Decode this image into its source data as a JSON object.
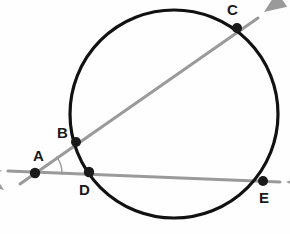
{
  "figure": {
    "background_color": "#fefefe"
  },
  "chart_data": {
    "type": "diagram",
    "subtype": "euclidean-geometry",
    "title": "",
    "canvas": {
      "width": 290,
      "height": 234
    },
    "circle": {
      "name": "main-circle",
      "cx": 174,
      "cy": 114,
      "r": 104,
      "stroke": "#111111",
      "stroke_width": 3.2,
      "fill": "none"
    },
    "points": [
      {
        "id": "A",
        "label": "A",
        "x": 35,
        "y": 173,
        "label_x": 33,
        "label_y": 148,
        "dot_r": 5.2,
        "on_circle": false,
        "color": "#1a1a1a"
      },
      {
        "id": "B",
        "label": "B",
        "x": 76,
        "y": 142,
        "label_x": 57,
        "label_y": 125,
        "dot_r": 5.0,
        "on_circle": true,
        "color": "#1a1a1a"
      },
      {
        "id": "C",
        "label": "C",
        "x": 237,
        "y": 28,
        "label_x": 227,
        "label_y": 2,
        "dot_r": 5.0,
        "on_circle": true,
        "color": "#1a1a1a"
      },
      {
        "id": "D",
        "label": "D",
        "x": 89,
        "y": 172,
        "label_x": 79,
        "label_y": 182,
        "dot_r": 5.2,
        "on_circle": true,
        "color": "#1a1a1a"
      },
      {
        "id": "E",
        "label": "E",
        "x": 263,
        "y": 181,
        "label_x": 259,
        "label_y": 190,
        "dot_r": 5.0,
        "on_circle": true,
        "color": "#1a1a1a"
      }
    ],
    "rays": [
      {
        "id": "ray-ABC",
        "name": "secant-through-B-and-C",
        "from": "A",
        "through": [
          "B",
          "C"
        ],
        "stroke": "#9a9a9a",
        "stroke_width": 3.0,
        "x1": 20,
        "y1": 184,
        "x2": 258,
        "y2": 18,
        "arrow_at_start": true,
        "arrow_at_end": true
      },
      {
        "id": "ray-ADE",
        "name": "secant-through-D-and-E",
        "from": "A",
        "through": [
          "D",
          "E"
        ],
        "stroke": "#9a9a9a",
        "stroke_width": 3.0,
        "x1": 8,
        "y1": 171,
        "x2": 280,
        "y2": 182,
        "arrow_at_start": true,
        "arrow_at_end": true
      }
    ],
    "arrowheads": [
      {
        "id": "arrow-upper-left",
        "name": "arrowhead-down-left",
        "tip_x": 4,
        "tip_y": 190,
        "angle_deg": 215,
        "color": "#9a9a9a"
      },
      {
        "id": "arrow-lower-left",
        "name": "arrowhead-left",
        "tip_x": 2,
        "tip_y": 171,
        "angle_deg": 182,
        "color": "#9a9a9a"
      },
      {
        "id": "arrow-top-right",
        "name": "arrowhead-up-right",
        "tip_x": 264,
        "tip_y": 12,
        "angle_deg": 325,
        "color": "#9a9a9a"
      },
      {
        "id": "arrow-right",
        "name": "arrowhead-right",
        "tip_x": 286,
        "tip_y": 182,
        "angle_deg": 2,
        "color": "#9a9a9a"
      }
    ],
    "angle_marks": [
      {
        "id": "angle-at-A",
        "name": "angle-arc-at-vertex-A",
        "vertex": "A",
        "radius": 27,
        "stroke": "#9a9a9a",
        "stroke_width": 1.4,
        "start_deg": -36.5,
        "end_deg": 2.3
      }
    ],
    "labels": [
      "A",
      "B",
      "C",
      "D",
      "E"
    ],
    "legend": []
  }
}
